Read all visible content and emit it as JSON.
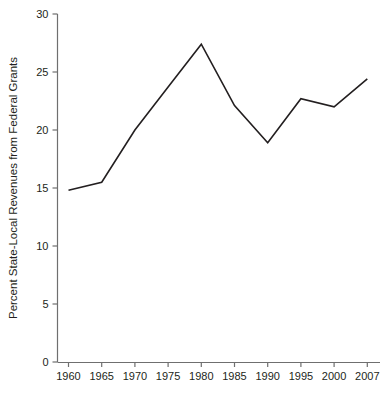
{
  "chart_data": {
    "type": "line",
    "title": "",
    "subtitle": "",
    "xlabel": "",
    "ylabel": "Percent State-Local Revenues from Federal Grants",
    "categories": [
      "1960",
      "1965",
      "1970",
      "1975",
      "1980",
      "1985",
      "1990",
      "1995",
      "2000",
      "2007"
    ],
    "x": [
      1960,
      1965,
      1970,
      1975,
      1980,
      1985,
      1990,
      1995,
      2000,
      2007
    ],
    "values": [
      14.8,
      15.5,
      20.0,
      23.7,
      27.4,
      22.1,
      18.9,
      22.7,
      22.0,
      24.4
    ],
    "series": [
      {
        "name": "Percent State-Local Revenues from Federal Grants",
        "values": [
          14.8,
          15.5,
          20.0,
          23.7,
          27.4,
          22.1,
          18.9,
          22.7,
          22.0,
          24.4
        ]
      }
    ],
    "ylim": [
      0,
      30
    ],
    "yticks": [
      0,
      5,
      10,
      15,
      20,
      25,
      30
    ],
    "ytick_labels": [
      "0",
      "5",
      "10",
      "15",
      "20",
      "25",
      "30"
    ],
    "xtick_labels": [
      "1960",
      "1965",
      "1970",
      "1975",
      "1980",
      "1985",
      "1990",
      "1995",
      "2000",
      "2007"
    ],
    "grid": false,
    "legend": false,
    "legend_position": "none",
    "line_color": "#231f20",
    "line_width": 1.6,
    "axis_color": "#6f6f6f",
    "background_color": "#ffffff",
    "annotations": []
  },
  "axes": {
    "y_axis_title": "Percent State-Local Revenues from Federal Grants",
    "x_axis_title": ""
  }
}
